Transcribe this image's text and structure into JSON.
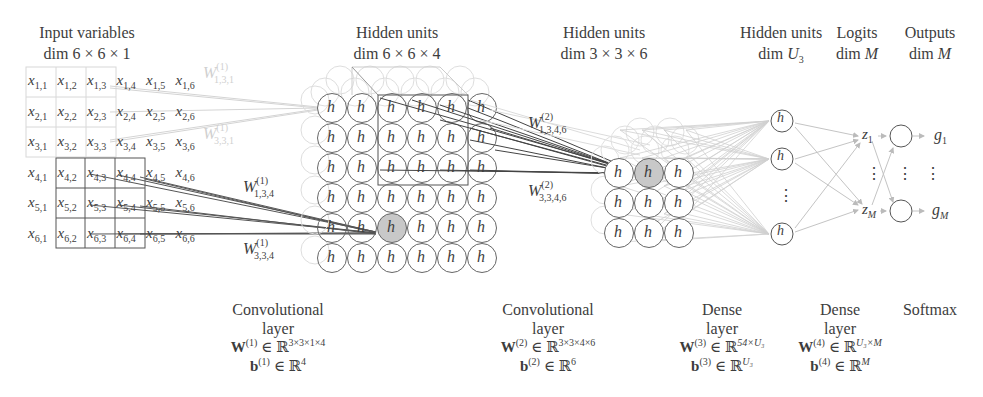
{
  "headers": {
    "input": {
      "title": "Input variables",
      "dim": "dim 6 × 6 × 1"
    },
    "hidden1": {
      "title": "Hidden units",
      "dim": "dim 6 × 6 × 4"
    },
    "hidden2": {
      "title": "Hidden units",
      "dim": "dim 3 × 3 × 6"
    },
    "hidden3": {
      "title": "Hidden units",
      "dim_prefix": "dim ",
      "dim_var": "U",
      "dim_sub": "3"
    },
    "logits": {
      "title": "Logits",
      "dim_prefix": "dim ",
      "dim_var": "M"
    },
    "outputs": {
      "title": "Outputs",
      "dim_prefix": "dim ",
      "dim_var": "M"
    }
  },
  "input_grid": {
    "rows": 6,
    "cols": 6,
    "symbol": "x",
    "cells": [
      [
        "1,1",
        "1,2",
        "1,3",
        "1,4",
        "1,5",
        "1,6"
      ],
      [
        "2,1",
        "2,2",
        "2,3",
        "2,4",
        "2,5",
        "2,6"
      ],
      [
        "3,1",
        "3,2",
        "3,3",
        "3,4",
        "3,5",
        "3,6"
      ],
      [
        "4,1",
        "4,2",
        "4,3",
        "4,4",
        "4,5",
        "4,6"
      ],
      [
        "5,1",
        "5,2",
        "5,3",
        "5,4",
        "5,5",
        "5,6"
      ],
      [
        "6,1",
        "6,2",
        "6,3",
        "6,4",
        "6,5",
        "6,6"
      ]
    ]
  },
  "weight_labels": {
    "w1_faint_top": {
      "sym": "W",
      "sup": "(1)",
      "sub": "1,3,1"
    },
    "w1_faint_mid": {
      "sym": "W",
      "sup": "(1)",
      "sub": "3,3,1"
    },
    "w1_134": {
      "sym": "W",
      "sup": "(1)",
      "sub": "1,3,4"
    },
    "w1_334": {
      "sym": "W",
      "sup": "(1)",
      "sub": "3,3,4"
    },
    "w2_1346": {
      "sym": "W",
      "sup": "(2)",
      "sub": "1,3,4,6"
    },
    "w2_3346": {
      "sym": "W",
      "sup": "(2)",
      "sub": "3,3,4,6"
    }
  },
  "unit_label": "h",
  "dense_dots": "⋮",
  "logits": {
    "top": {
      "sym": "z",
      "sub": "1"
    },
    "bottom": {
      "sym": "z",
      "sub": "M"
    }
  },
  "outputs": {
    "top": {
      "sym": "g",
      "sub": "1"
    },
    "bottom": {
      "sym": "g",
      "sub": "M"
    }
  },
  "footers": {
    "conv1": {
      "title": "Convolutional",
      "subtitle": "layer",
      "w": "W",
      "w_sup": "(1)",
      "w_space": "3×3×1×4",
      "b": "b",
      "b_sup": "(1)",
      "b_space": "4"
    },
    "conv2": {
      "title": "Convolutional",
      "subtitle": "layer",
      "w": "W",
      "w_sup": "(2)",
      "w_space": "3×3×4×6",
      "b": "b",
      "b_sup": "(2)",
      "b_space": "6"
    },
    "dense3": {
      "title": "Dense",
      "subtitle": "layer",
      "w": "W",
      "w_sup": "(3)",
      "w_space": "54×U₃",
      "b": "b",
      "b_sup": "(3)",
      "b_space": "U₃"
    },
    "dense4": {
      "title": "Dense",
      "subtitle": "layer",
      "w": "W",
      "w_sup": "(4)",
      "w_space": "U₃×M",
      "b": "b",
      "b_sup": "(4)",
      "b_space": "M"
    },
    "softmax": {
      "title": "Softmax"
    }
  },
  "symbols": {
    "element_of": "∈",
    "reals": "ℝ"
  },
  "colors": {
    "ink": "#3d3d3d",
    "faint": "#cfcfcf",
    "highlight_fill": "#c8c8c8",
    "line_gray": "#b8b8b8"
  }
}
